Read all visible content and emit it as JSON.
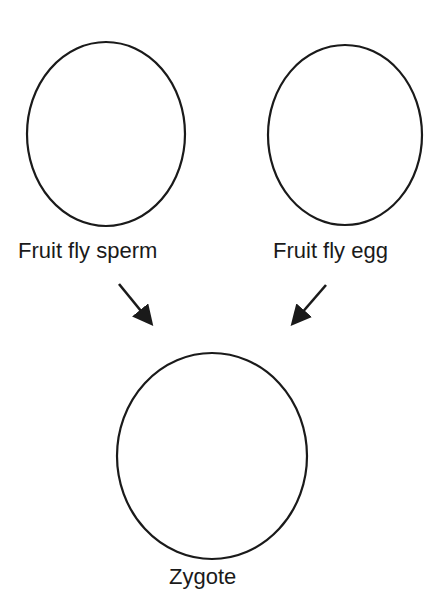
{
  "diagram": {
    "nodes": [
      {
        "id": "sperm",
        "label": "Fruit fly sperm"
      },
      {
        "id": "egg",
        "label": "Fruit fly egg"
      },
      {
        "id": "zygote",
        "label": "Zygote"
      }
    ],
    "edges": [
      {
        "from": "sperm",
        "to": "zygote"
      },
      {
        "from": "egg",
        "to": "zygote"
      }
    ],
    "colors": {
      "stroke": "#1a1a1a",
      "background": "#ffffff"
    }
  }
}
